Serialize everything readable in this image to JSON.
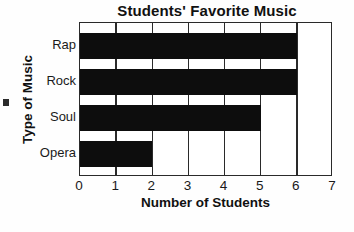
{
  "chart_data": {
    "type": "bar",
    "orientation": "horizontal",
    "title": "Students' Favorite Music",
    "xlabel": "Number of Students",
    "ylabel": "Type of Music",
    "categories": [
      "Rap",
      "Rock",
      "Soul",
      "Opera"
    ],
    "values": [
      6,
      6,
      5,
      2
    ],
    "xlim": [
      0,
      7
    ],
    "xticks": [
      "0",
      "1",
      "2",
      "3",
      "4",
      "5",
      "6",
      "7"
    ],
    "grid": "vertical",
    "legend": null,
    "bar_color": "#0d0d0d",
    "axis_color": "#2a2a2a",
    "background": "#ffffff"
  }
}
